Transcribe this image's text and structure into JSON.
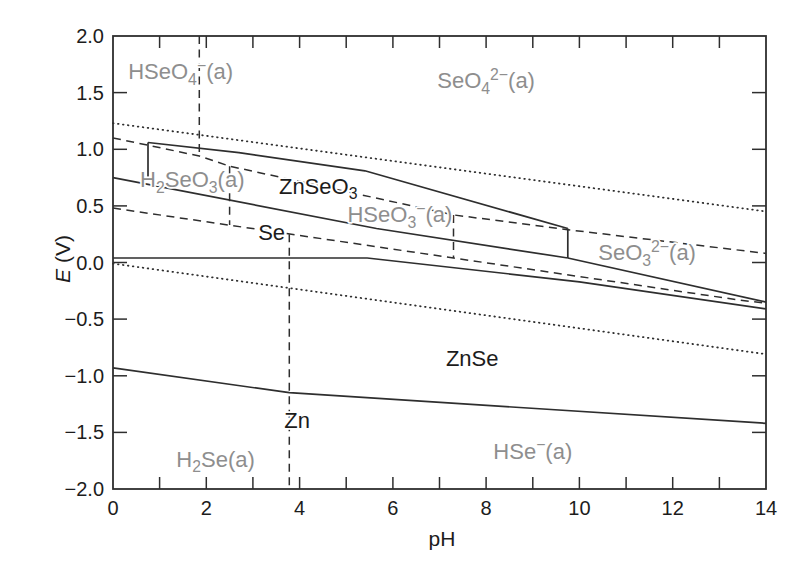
{
  "figure": {
    "background": "#ffffff",
    "line_color": "#2e2e2e",
    "axis_color": "#2e2e2e",
    "aqueous_label_color": "#8e8e8e",
    "solid_label_color": "#1c1c1c"
  },
  "chart_data": {
    "type": "line",
    "title": "",
    "xlabel": "pH",
    "ylabel_italic": "E",
    "ylabel_units": " (V)",
    "xlim": [
      0,
      14
    ],
    "ylim": [
      -2.0,
      2.0
    ],
    "grid": false,
    "legend": "none",
    "x_tick_labels": [
      "0",
      "2",
      "4",
      "6",
      "8",
      "10",
      "12",
      "14"
    ],
    "x_tick_values": [
      0,
      2,
      4,
      6,
      8,
      10,
      12,
      14
    ],
    "x_axis_minor_ticks": [
      1,
      2,
      3,
      4,
      5,
      6,
      7,
      8,
      9,
      10,
      11,
      12,
      13
    ],
    "y_tick_labels": [
      "2.0",
      "1.5",
      "1.0",
      "0.5",
      "0.0",
      "−0.5",
      "−1.0",
      "−1.5",
      "−2.0"
    ],
    "y_tick_values": [
      2.0,
      1.5,
      1.0,
      0.5,
      0.0,
      -0.5,
      -1.0,
      -1.5,
      -2.0
    ],
    "y_axis_side_ticks": [
      1.5,
      1.0,
      0.5,
      0.0,
      -0.5,
      -1.0,
      -1.5
    ],
    "lines": [
      {
        "name": "oxygen-water-line",
        "style": "dotted",
        "points": [
          [
            0,
            1.23
          ],
          [
            14,
            0.45
          ]
        ]
      },
      {
        "name": "hydrogen-water-line",
        "style": "dotted",
        "points": [
          [
            0,
            -0.01
          ],
          [
            14,
            -0.81
          ]
        ]
      },
      {
        "name": "hseo4-seo4-boundary",
        "style": "dashed",
        "points": [
          [
            1.85,
            2.0
          ],
          [
            1.85,
            0.94
          ]
        ]
      },
      {
        "name": "se6-se4-boundary",
        "style": "dashed",
        "points": [
          [
            0,
            1.1
          ],
          [
            1.85,
            0.94
          ],
          [
            2.5,
            0.85
          ],
          [
            7.3,
            0.42
          ],
          [
            9.75,
            0.29
          ],
          [
            14,
            0.08
          ]
        ]
      },
      {
        "name": "h2seo3-hseo3-boundary",
        "style": "dashed",
        "points": [
          [
            2.5,
            0.85
          ],
          [
            2.5,
            0.33
          ]
        ]
      },
      {
        "name": "hseo3-seo3-boundary",
        "style": "dashed",
        "points": [
          [
            7.3,
            0.42
          ],
          [
            7.3,
            0.04
          ]
        ]
      },
      {
        "name": "se4-se-minus2-boundary",
        "style": "dashed",
        "points": [
          [
            0,
            0.48
          ],
          [
            7.3,
            0.04
          ],
          [
            13.4,
            -0.33
          ],
          [
            14,
            -0.36
          ]
        ]
      },
      {
        "name": "h2se-hse-boundary",
        "style": "dashed",
        "points": [
          [
            3.78,
            0.25
          ],
          [
            3.78,
            -2.0
          ]
        ]
      },
      {
        "name": "znseo3-left-edge",
        "style": "solid",
        "points": [
          [
            0.75,
            1.06
          ],
          [
            0.75,
            0.75
          ]
        ]
      },
      {
        "name": "znseo3-top-boundary",
        "style": "solid",
        "points": [
          [
            0.75,
            1.06
          ],
          [
            2.7,
            0.97
          ],
          [
            5.4,
            0.81
          ],
          [
            9.75,
            0.3
          ]
        ]
      },
      {
        "name": "znseo3-right-edge",
        "style": "solid",
        "points": [
          [
            9.75,
            0.3
          ],
          [
            9.75,
            0.04
          ]
        ]
      },
      {
        "name": "se-upper-boundary",
        "style": "solid",
        "points": [
          [
            0,
            0.75
          ],
          [
            5.65,
            0.3
          ],
          [
            9.75,
            0.04
          ]
        ]
      },
      {
        "name": "znse-seo3-boundary",
        "style": "solid",
        "points": [
          [
            9.75,
            0.04
          ],
          [
            14,
            -0.35
          ]
        ]
      },
      {
        "name": "se-znse-boundary",
        "style": "solid",
        "points": [
          [
            0,
            0.04
          ],
          [
            5.45,
            0.04
          ],
          [
            10.0,
            -0.17
          ],
          [
            14,
            -0.41
          ]
        ]
      },
      {
        "name": "znse-zn-boundary",
        "style": "solid",
        "points": [
          [
            0,
            -0.93
          ],
          [
            3.78,
            -1.15
          ],
          [
            14,
            -1.42
          ]
        ]
      }
    ],
    "region_labels": [
      {
        "name": "hseo4-region-label",
        "text": "HSeO_{4}^{−}(a)",
        "ph": 1.45,
        "e": 1.68,
        "color": "gray"
      },
      {
        "name": "seo4-region-label",
        "text": "SeO_{4}^{2−}(a)",
        "ph": 8.0,
        "e": 1.6,
        "color": "gray"
      },
      {
        "name": "h2seo3-region-label",
        "text": "H_{2}SeO_{3}(a)",
        "ph": 1.7,
        "e": 0.73,
        "color": "gray"
      },
      {
        "name": "znseo3-region-label",
        "text": "ZnSeO_{3}",
        "ph": 4.4,
        "e": 0.67,
        "color": "dark"
      },
      {
        "name": "hseo3-region-label",
        "text": "HSeO_{3}^{−}(a)",
        "ph": 6.15,
        "e": 0.42,
        "color": "gray"
      },
      {
        "name": "se-region-label",
        "text": "Se",
        "ph": 3.4,
        "e": 0.26,
        "color": "dark"
      },
      {
        "name": "seo3-region-label",
        "text": "SeO_{3}^{2−}(a)",
        "ph": 11.45,
        "e": 0.08,
        "color": "gray"
      },
      {
        "name": "znse-region-label",
        "text": "ZnSe",
        "ph": 7.7,
        "e": -0.85,
        "color": "dark"
      },
      {
        "name": "zn-region-label",
        "text": "Zn",
        "ph": 3.95,
        "e": -1.4,
        "color": "dark"
      },
      {
        "name": "h2se-region-label",
        "text": "H_{2}Se(a)",
        "ph": 2.2,
        "e": -1.74,
        "color": "gray"
      },
      {
        "name": "hse-region-label",
        "text": "HSe^{−}(a)",
        "ph": 9.0,
        "e": -1.67,
        "color": "gray"
      }
    ]
  }
}
